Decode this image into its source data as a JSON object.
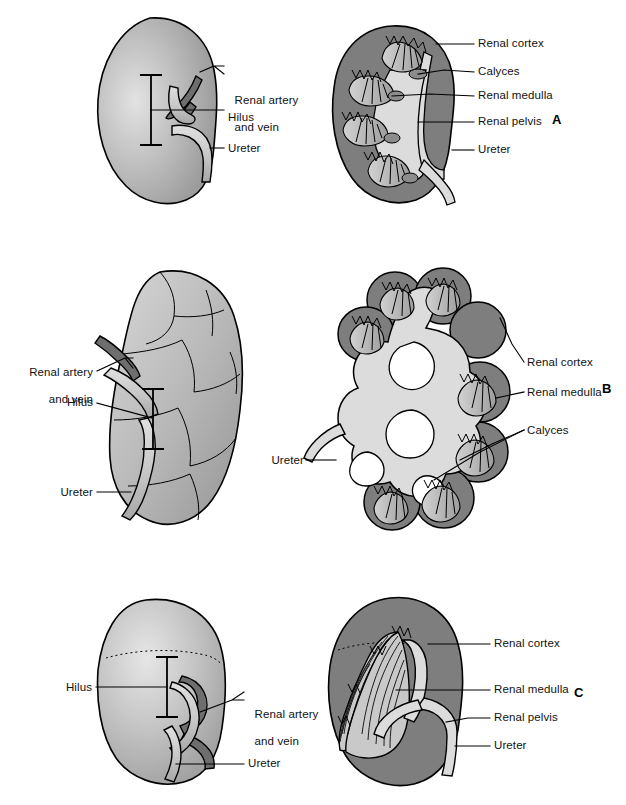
{
  "figure": {
    "panels": [
      {
        "letter": "A",
        "letter_pos": {
          "x": 552,
          "y": 118
        },
        "views": [
          {
            "view": "external",
            "side": "left",
            "labels": [
              {
                "id": "renal-artery-and-vein",
                "line1": "Renal artery",
                "line2": "and vein",
                "x": 228,
                "y": 80,
                "align": "left"
              },
              {
                "id": "hilus",
                "line1": "Hilus",
                "line2": "",
                "x": 228,
                "y": 118,
                "align": "left"
              },
              {
                "id": "ureter",
                "line1": "Ureter",
                "line2": "",
                "x": 228,
                "y": 145,
                "align": "left"
              }
            ]
          },
          {
            "view": "cross-section",
            "side": "right",
            "labels": [
              {
                "id": "renal-cortex",
                "line1": "Renal cortex",
                "line2": "",
                "x": 478,
                "y": 39,
                "align": "left"
              },
              {
                "id": "calyces",
                "line1": "Calyces",
                "line2": "",
                "x": 478,
                "y": 68,
                "align": "left"
              },
              {
                "id": "renal-medulla",
                "line1": "Renal medulla",
                "line2": "",
                "x": 478,
                "y": 92,
                "align": "left"
              },
              {
                "id": "renal-pelvis",
                "line1": "Renal pelvis",
                "line2": "",
                "x": 478,
                "y": 118,
                "align": "left"
              },
              {
                "id": "ureter",
                "line1": "Ureter",
                "line2": "",
                "x": 478,
                "y": 146,
                "align": "left"
              }
            ]
          }
        ]
      },
      {
        "letter": "B",
        "letter_pos": {
          "x": 602,
          "y": 387
        },
        "views": [
          {
            "view": "external-lobulated",
            "side": "left",
            "labels": [
              {
                "id": "renal-artery-and-vein",
                "line1": "Renal artery",
                "line2": "and vein",
                "x": 93,
                "y": 360,
                "align": "right"
              },
              {
                "id": "hilus",
                "line1": "Hilus",
                "line2": "",
                "x": 93,
                "y": 402,
                "align": "right"
              },
              {
                "id": "ureter",
                "line1": "Ureter",
                "line2": "",
                "x": 93,
                "y": 490,
                "align": "right"
              }
            ]
          },
          {
            "view": "cross-section-lobulated",
            "side": "right",
            "labels": [
              {
                "id": "renal-cortex",
                "line1": "Renal cortex",
                "line2": "",
                "x": 527,
                "y": 358,
                "align": "left"
              },
              {
                "id": "renal-medulla",
                "line1": "Renal medulla",
                "line2": "",
                "x": 527,
                "y": 388,
                "align": "left"
              },
              {
                "id": "calyces",
                "line1": "Calyces",
                "line2": "",
                "x": 527,
                "y": 425,
                "align": "left"
              },
              {
                "id": "ureter",
                "line1": "Ureter",
                "line2": "",
                "x": 314,
                "y": 440,
                "align": "right"
              }
            ]
          }
        ]
      },
      {
        "letter": "C",
        "letter_pos": {
          "x": 574,
          "y": 691
        },
        "views": [
          {
            "view": "external",
            "side": "left",
            "labels": [
              {
                "id": "hilus",
                "line1": "Hilus",
                "line2": "",
                "x": 92,
                "y": 691,
                "align": "right"
              },
              {
                "id": "renal-artery-and-vein",
                "line1": "Renal artery",
                "line2": "and vein",
                "x": 248,
                "y": 695,
                "align": "left"
              },
              {
                "id": "ureter",
                "line1": "Ureter",
                "line2": "",
                "x": 248,
                "y": 750,
                "align": "left"
              }
            ]
          },
          {
            "view": "cross-section",
            "side": "right",
            "labels": [
              {
                "id": "renal-cortex",
                "line1": "Renal cortex",
                "line2": "",
                "x": 494,
                "y": 640,
                "align": "left"
              },
              {
                "id": "renal-medulla",
                "line1": "Renal medulla",
                "line2": "",
                "x": 494,
                "y": 687,
                "align": "left"
              },
              {
                "id": "renal-pelvis",
                "line1": "Renal pelvis",
                "line2": "",
                "x": 494,
                "y": 714,
                "align": "left"
              },
              {
                "id": "ureter",
                "line1": "Ureter",
                "line2": "",
                "x": 494,
                "y": 741,
                "align": "left"
              }
            ]
          }
        ]
      }
    ],
    "colors": {
      "background": "#ffffff",
      "cortex_dark": "#7e7e7e",
      "parenchyma_mid": "#a8a8a8",
      "parenchyma_light": "#c9c9c9",
      "pelvis_light": "#dcdcdc",
      "medulla_mid": "#b4b4b4",
      "medulla_dark": "#8c8c8c",
      "artery_dark": "#6e6e6e",
      "vein_light": "#cfcfcf",
      "outline": "#000000",
      "highlight": "#eeeeee"
    }
  }
}
